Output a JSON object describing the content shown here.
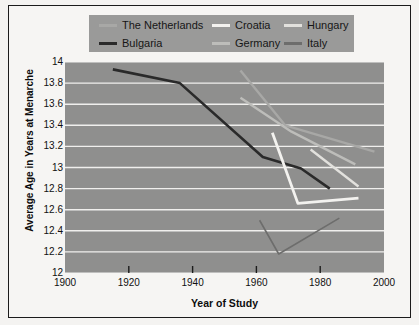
{
  "figure": {
    "background": "#f6f5f3",
    "plot_background": "#8f8f8e",
    "gridline_color": "#f0efed",
    "border_color": "#1b1b1b"
  },
  "legend": {
    "background": "#9a9a99",
    "items": [
      {
        "label": "The Netherlands",
        "color": "#a8a8a6",
        "name": "netherlands"
      },
      {
        "label": "Croatia",
        "color": "#f3f2ef",
        "name": "croatia"
      },
      {
        "label": "Hungary",
        "color": "#e2e1dd",
        "name": "hungary"
      },
      {
        "label": "Bulgaria",
        "color": "#2a2a2a",
        "name": "bulgaria"
      },
      {
        "label": "Germany",
        "color": "#bdbdba",
        "name": "germany"
      },
      {
        "label": "Italy",
        "color": "#6d6d6c",
        "name": "italy"
      }
    ]
  },
  "chart_data": {
    "type": "line",
    "title": "",
    "xlabel": "Year of Study",
    "ylabel": "Average Age in Years at Menarche",
    "xlim": [
      1900,
      2000
    ],
    "ylim": [
      12,
      14
    ],
    "xticks": [
      1900,
      1920,
      1940,
      1960,
      1980,
      2000
    ],
    "ytick_labels": [
      "14",
      "13.8",
      "13.6",
      "13.4",
      "13.2",
      "13",
      "12.8",
      "12.6",
      "12.4",
      "12.2",
      "12"
    ],
    "yticks": [
      14,
      13.8,
      13.6,
      13.4,
      13.2,
      13,
      12.8,
      12.6,
      12.4,
      12.2,
      12
    ],
    "grid": true,
    "grid_axis": "y",
    "legend_position": "top",
    "series": [
      {
        "name": "Bulgaria",
        "color": "#2a2a2a",
        "width": 2.6,
        "points": [
          [
            1915,
            13.93
          ],
          [
            1936,
            13.8
          ],
          [
            1962,
            13.1
          ],
          [
            1974,
            12.99
          ],
          [
            1983,
            12.8
          ]
        ]
      },
      {
        "name": "The Netherlands",
        "color": "#a8a8a6",
        "width": 2.4,
        "points": [
          [
            1955,
            13.92
          ],
          [
            1969,
            13.4
          ],
          [
            1997,
            13.15
          ]
        ]
      },
      {
        "name": "Germany",
        "color": "#bdbdba",
        "width": 2.4,
        "points": [
          [
            1955,
            13.66
          ],
          [
            1971,
            13.34
          ],
          [
            1991,
            13.03
          ]
        ]
      },
      {
        "name": "Hungary",
        "color": "#e2e1dd",
        "width": 2.4,
        "points": [
          [
            1977,
            13.17
          ],
          [
            1992,
            12.82
          ]
        ]
      },
      {
        "name": "Croatia",
        "color": "#f3f2ef",
        "width": 2.8,
        "points": [
          [
            1965,
            13.33
          ],
          [
            1973,
            12.66
          ],
          [
            1992,
            12.71
          ]
        ]
      },
      {
        "name": "Italy",
        "color": "#6d6d6c",
        "width": 1.6,
        "points": [
          [
            1961,
            12.5
          ],
          [
            1967,
            12.18
          ],
          [
            1986,
            12.52
          ]
        ]
      }
    ]
  }
}
